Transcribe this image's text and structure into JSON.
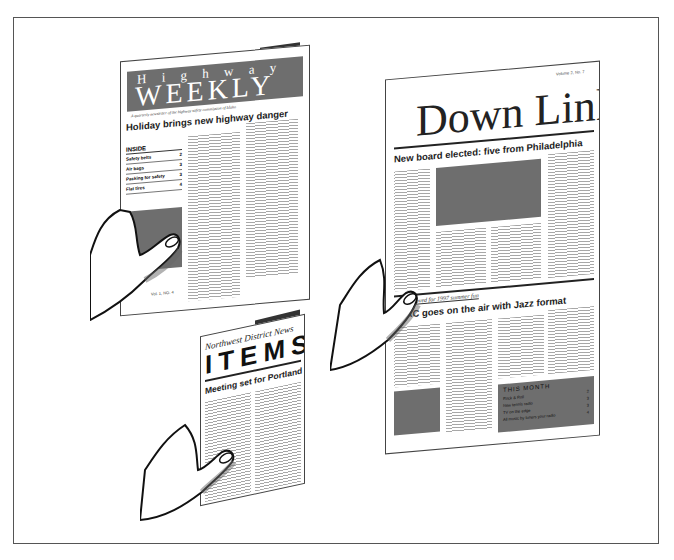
{
  "illustration": {
    "description": "Three hands holding three newsletters",
    "colors": {
      "frame": "#555555",
      "photo_grey": "#6e6e6e",
      "ink": "#222222",
      "dark_spine": "#333333"
    }
  },
  "highway_weekly": {
    "masthead_top": "H i g h w a y",
    "masthead_main": "WEEKLY",
    "subtitle": "A quarterly newsletter of the highway safety commission of Idaho",
    "headline": "Holiday brings new highway danger",
    "inside": {
      "title": "INSIDE",
      "items": [
        {
          "label": "Safety belts",
          "page": "2"
        },
        {
          "label": "Air bags",
          "page": "3"
        },
        {
          "label": "Packing for safety",
          "page": "3"
        },
        {
          "label": "Flat tires",
          "page": "4"
        }
      ]
    },
    "footer": "Vol. 1, NO. 4"
  },
  "down_link": {
    "volume": "Volume 2, No. 7",
    "masthead": "Down Link",
    "headline": "New board elected: five from Philadelphia",
    "kicker": "Approved for 1997 summer fun",
    "headline2": "WIAC goes on the air with Jazz format",
    "this_month": {
      "title": "THIS MONTH",
      "items": [
        {
          "label": "Rock & Roll",
          "page": "2"
        },
        {
          "label": "New tennis radio",
          "page": "3"
        },
        {
          "label": "TV on the edge",
          "page": "3"
        },
        {
          "label": "All music by tuners your radio",
          "page": "4"
        }
      ]
    }
  },
  "items_news": {
    "masthead_top": "Northwest District News",
    "masthead_main": "ITEMS",
    "headline": "Meeting set for Portland"
  }
}
